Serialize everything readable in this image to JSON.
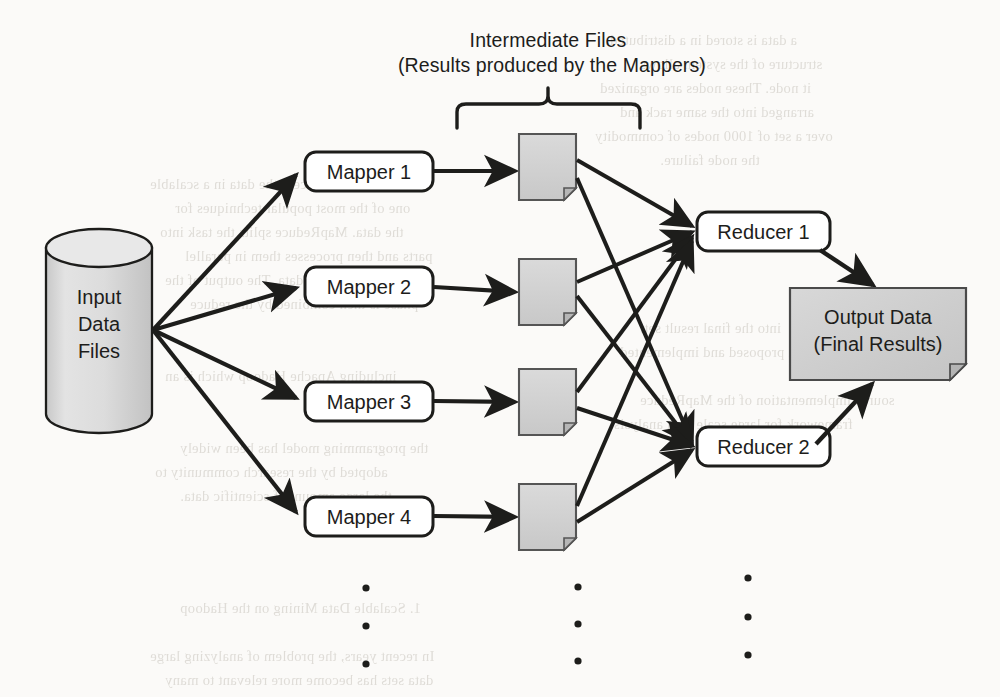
{
  "diagram": {
    "type": "mapreduce-dataflow",
    "caption": {
      "line1": "Intermediate  Files",
      "line2": "(Results produced by the Mappers)"
    },
    "input": {
      "label_line1": "Input",
      "label_line2": "Data",
      "label_line3": "Files",
      "shape": "cylinder",
      "fill": "#d9d9d9"
    },
    "mappers": [
      {
        "label": "Mapper 1"
      },
      {
        "label": "Mapper 2"
      },
      {
        "label": "Mapper 3"
      },
      {
        "label": "Mapper 4"
      }
    ],
    "intermediate_files": [
      {
        "name": "intermediate-file-1"
      },
      {
        "name": "intermediate-file-2"
      },
      {
        "name": "intermediate-file-3"
      },
      {
        "name": "intermediate-file-4"
      }
    ],
    "reducers": [
      {
        "label": "Reducer 1"
      },
      {
        "label": "Reducer 2"
      }
    ],
    "output": {
      "label_line1": "Output Data",
      "label_line2": "(Final Results)",
      "shape": "document",
      "fill": "#cfcfcf"
    },
    "ellipses": [
      {
        "name": "ellipsis-mappers",
        "dots": 3
      },
      {
        "name": "ellipsis-files",
        "dots": 3
      },
      {
        "name": "ellipsis-reducers",
        "dots": 3
      }
    ],
    "colors": {
      "stroke": "#1d1d1b",
      "shape_fill_gray": "#d2d2d2",
      "node_fill_white": "#ffffff",
      "background": "#fbfaf8"
    }
  },
  "scan_artifacts": {
    "bleed_lines": [
      "a data is stored in a distributed",
      "structure of the system allows",
      "it node. These nodes are organized",
      "arranged into the same rack and",
      "over a set of 1000 nodes of commodity",
      "the node failure.",
      "In order to process the data in a scalable",
      "one of the most popular techniques for",
      "the data. MapReduce splits the task into",
      "parts and then processes them in parallel",
      "each part of the data. The output of the",
      "phase is then combined by the reduce",
      "into the final result set.",
      "have been proposed and implemented",
      "including Apache Hadoop which is an",
      "source implementation of the MapReduce",
      "framework for large scale data analysis.",
      "the programming model has been widely",
      "adopted by the research community to",
      "the large amount of scientific data.",
      "1. Scalable Data Mining on the Hadoop",
      "In recent years, the problem of analyzing large",
      "data sets has become more relevant to many"
    ]
  }
}
